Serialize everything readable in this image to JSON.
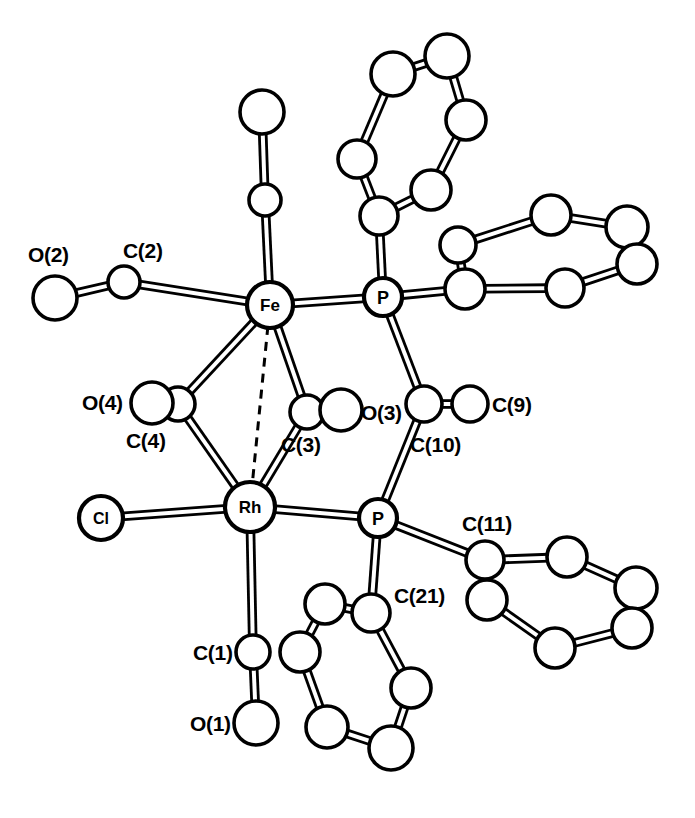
{
  "figure": {
    "background_color": "#ffffff",
    "line_color": "#000000",
    "width": 695,
    "height": 818
  },
  "chart_data": {
    "type": "diagram",
    "title": "",
    "atoms": [
      {
        "id": "Fe",
        "label": "Fe",
        "x": 270,
        "y": 305,
        "r": 23,
        "core_label": true,
        "font_size": 17
      },
      {
        "id": "Rh",
        "label": "Rh",
        "x": 250,
        "y": 507,
        "r": 25,
        "core_label": true,
        "font_size": 17
      },
      {
        "id": "P1",
        "label": "P",
        "x": 383,
        "y": 297,
        "r": 19,
        "core_label": true,
        "font_size": 18
      },
      {
        "id": "P2",
        "label": "P",
        "x": 378,
        "y": 518,
        "r": 19,
        "core_label": true,
        "font_size": 18
      },
      {
        "id": "Cl",
        "label": "Cl",
        "x": 101,
        "y": 518,
        "r": 22,
        "core_label": true,
        "font_size": 16
      },
      {
        "id": "C2",
        "label": "",
        "x": 124,
        "y": 282,
        "r": 16,
        "core_label": false,
        "font_size": 0
      },
      {
        "id": "O2",
        "label": "",
        "x": 55,
        "y": 298,
        "r": 22,
        "core_label": false,
        "font_size": 0
      },
      {
        "id": "C5",
        "label": "",
        "x": 265,
        "y": 200,
        "r": 16,
        "core_label": false,
        "font_size": 0
      },
      {
        "id": "O5",
        "label": "",
        "x": 262,
        "y": 112,
        "r": 22,
        "core_label": false,
        "font_size": 0
      },
      {
        "id": "C1",
        "label": "",
        "x": 253,
        "y": 652,
        "r": 17,
        "core_label": false,
        "font_size": 0
      },
      {
        "id": "O1",
        "label": "",
        "x": 256,
        "y": 723,
        "r": 22,
        "core_label": false,
        "font_size": 0
      },
      {
        "id": "C3",
        "label": "",
        "x": 307,
        "y": 412,
        "r": 17,
        "core_label": false,
        "font_size": 0
      },
      {
        "id": "O3",
        "label": "",
        "x": 341,
        "y": 410,
        "r": 21,
        "core_label": false,
        "font_size": 0
      },
      {
        "id": "C4",
        "label": "",
        "x": 178,
        "y": 404,
        "r": 17,
        "core_label": false,
        "font_size": 0
      },
      {
        "id": "O4",
        "label": "",
        "x": 152,
        "y": 403,
        "r": 21,
        "core_label": false,
        "font_size": 0
      },
      {
        "id": "C10",
        "label": "",
        "x": 424,
        "y": 404,
        "r": 18,
        "core_label": false,
        "font_size": 0
      },
      {
        "id": "C9",
        "label": "",
        "x": 470,
        "y": 404,
        "r": 18,
        "core_label": false,
        "font_size": 0
      },
      {
        "id": "C11",
        "label": "",
        "x": 485,
        "y": 560,
        "r": 19,
        "core_label": false,
        "font_size": 0
      },
      {
        "id": "C21",
        "label": "",
        "x": 371,
        "y": 613,
        "r": 19,
        "core_label": false,
        "font_size": 0
      },
      {
        "id": "RA1",
        "label": "",
        "x": 379,
        "y": 216,
        "r": 19,
        "core_label": false,
        "font_size": 0
      },
      {
        "id": "RA2",
        "label": "",
        "x": 357,
        "y": 159,
        "r": 19,
        "core_label": false,
        "font_size": 0
      },
      {
        "id": "RA3",
        "label": "",
        "x": 393,
        "y": 74,
        "r": 22,
        "core_label": false,
        "font_size": 0
      },
      {
        "id": "RA4",
        "label": "",
        "x": 447,
        "y": 56,
        "r": 22,
        "core_label": false,
        "font_size": 0
      },
      {
        "id": "RA5",
        "label": "",
        "x": 466,
        "y": 120,
        "r": 20,
        "core_label": false,
        "font_size": 0
      },
      {
        "id": "RA6",
        "label": "",
        "x": 431,
        "y": 190,
        "r": 20,
        "core_label": false,
        "font_size": 0
      },
      {
        "id": "RB1",
        "label": "",
        "x": 465,
        "y": 289,
        "r": 20,
        "core_label": false,
        "font_size": 0
      },
      {
        "id": "RB2",
        "label": "",
        "x": 458,
        "y": 245,
        "r": 18,
        "core_label": false,
        "font_size": 0
      },
      {
        "id": "RB3",
        "label": "",
        "x": 551,
        "y": 215,
        "r": 20,
        "core_label": false,
        "font_size": 0
      },
      {
        "id": "RB4",
        "label": "",
        "x": 627,
        "y": 227,
        "r": 21,
        "core_label": false,
        "font_size": 0
      },
      {
        "id": "RB5",
        "label": "",
        "x": 637,
        "y": 264,
        "r": 20,
        "core_label": false,
        "font_size": 0
      },
      {
        "id": "RB6",
        "label": "",
        "x": 565,
        "y": 288,
        "r": 19,
        "core_label": false,
        "font_size": 0
      },
      {
        "id": "RC1",
        "label": "",
        "x": 487,
        "y": 600,
        "r": 20,
        "core_label": false,
        "font_size": 0
      },
      {
        "id": "RC2",
        "label": "",
        "x": 567,
        "y": 557,
        "r": 20,
        "core_label": false,
        "font_size": 0
      },
      {
        "id": "RC3",
        "label": "",
        "x": 636,
        "y": 588,
        "r": 21,
        "core_label": false,
        "font_size": 0
      },
      {
        "id": "RC4",
        "label": "",
        "x": 632,
        "y": 628,
        "r": 20,
        "core_label": false,
        "font_size": 0
      },
      {
        "id": "RC5",
        "label": "",
        "x": 555,
        "y": 648,
        "r": 20,
        "core_label": false,
        "font_size": 0
      },
      {
        "id": "RD1",
        "label": "",
        "x": 325,
        "y": 604,
        "r": 20,
        "core_label": false,
        "font_size": 0
      },
      {
        "id": "RD2",
        "label": "",
        "x": 300,
        "y": 652,
        "r": 20,
        "core_label": false,
        "font_size": 0
      },
      {
        "id": "RD3",
        "label": "",
        "x": 327,
        "y": 727,
        "r": 21,
        "core_label": false,
        "font_size": 0
      },
      {
        "id": "RD4",
        "label": "",
        "x": 391,
        "y": 748,
        "r": 22,
        "core_label": false,
        "font_size": 0
      },
      {
        "id": "RD5",
        "label": "",
        "x": 411,
        "y": 688,
        "r": 20,
        "core_label": false,
        "font_size": 0
      }
    ],
    "bonds": [
      {
        "from": "Fe",
        "to": "Rh",
        "style": "dashed"
      },
      {
        "from": "Fe",
        "to": "C2",
        "style": "double"
      },
      {
        "from": "C2",
        "to": "O2",
        "style": "double"
      },
      {
        "from": "Fe",
        "to": "C5",
        "style": "double"
      },
      {
        "from": "C5",
        "to": "O5",
        "style": "double"
      },
      {
        "from": "Fe",
        "to": "P1",
        "style": "double"
      },
      {
        "from": "Fe",
        "to": "C3",
        "style": "double"
      },
      {
        "from": "Fe",
        "to": "C4",
        "style": "double"
      },
      {
        "from": "Rh",
        "to": "C3",
        "style": "double"
      },
      {
        "from": "Rh",
        "to": "C4",
        "style": "double"
      },
      {
        "from": "C3",
        "to": "O3",
        "style": "single"
      },
      {
        "from": "C4",
        "to": "O4",
        "style": "single"
      },
      {
        "from": "Rh",
        "to": "Cl",
        "style": "double"
      },
      {
        "from": "Rh",
        "to": "C1",
        "style": "double"
      },
      {
        "from": "C1",
        "to": "O1",
        "style": "double"
      },
      {
        "from": "Rh",
        "to": "P2",
        "style": "double"
      },
      {
        "from": "P1",
        "to": "C10",
        "style": "double"
      },
      {
        "from": "C10",
        "to": "P2",
        "style": "double"
      },
      {
        "from": "C10",
        "to": "C9",
        "style": "double"
      },
      {
        "from": "P1",
        "to": "RA1",
        "style": "double"
      },
      {
        "from": "RA1",
        "to": "RA2",
        "style": "double"
      },
      {
        "from": "RA2",
        "to": "RA3",
        "style": "double"
      },
      {
        "from": "RA3",
        "to": "RA4",
        "style": "double"
      },
      {
        "from": "RA4",
        "to": "RA5",
        "style": "double"
      },
      {
        "from": "RA5",
        "to": "RA6",
        "style": "double"
      },
      {
        "from": "RA6",
        "to": "RA1",
        "style": "double"
      },
      {
        "from": "P1",
        "to": "RB1",
        "style": "double"
      },
      {
        "from": "RB1",
        "to": "RB2",
        "style": "double"
      },
      {
        "from": "RB2",
        "to": "RB3",
        "style": "double"
      },
      {
        "from": "RB3",
        "to": "RB4",
        "style": "double"
      },
      {
        "from": "RB4",
        "to": "RB5",
        "style": "double"
      },
      {
        "from": "RB5",
        "to": "RB6",
        "style": "double"
      },
      {
        "from": "RB6",
        "to": "RB1",
        "style": "double"
      },
      {
        "from": "P2",
        "to": "C11",
        "style": "double"
      },
      {
        "from": "C11",
        "to": "RC1",
        "style": "double"
      },
      {
        "from": "C11",
        "to": "RC2",
        "style": "double"
      },
      {
        "from": "RC2",
        "to": "RC3",
        "style": "double"
      },
      {
        "from": "RC3",
        "to": "RC4",
        "style": "double"
      },
      {
        "from": "RC4",
        "to": "RC5",
        "style": "double"
      },
      {
        "from": "RC5",
        "to": "RC1",
        "style": "double"
      },
      {
        "from": "P2",
        "to": "C21",
        "style": "double"
      },
      {
        "from": "C21",
        "to": "RD1",
        "style": "double"
      },
      {
        "from": "C21",
        "to": "RD5",
        "style": "double"
      },
      {
        "from": "RD1",
        "to": "RD2",
        "style": "double"
      },
      {
        "from": "RD2",
        "to": "RD3",
        "style": "double"
      },
      {
        "from": "RD3",
        "to": "RD4",
        "style": "double"
      },
      {
        "from": "RD4",
        "to": "RD5",
        "style": "double"
      }
    ],
    "annotations": [
      {
        "id": "ann-O2",
        "text": "O(2)",
        "x": 28,
        "y": 262
      },
      {
        "id": "ann-C2",
        "text": "C(2)",
        "x": 123,
        "y": 258
      },
      {
        "id": "ann-O4",
        "text": "O(4)",
        "x": 82,
        "y": 410
      },
      {
        "id": "ann-C4",
        "text": "C(4)",
        "x": 126,
        "y": 448
      },
      {
        "id": "ann-C3",
        "text": "C(3)",
        "x": 281,
        "y": 452
      },
      {
        "id": "ann-O3",
        "text": "O(3)",
        "x": 361,
        "y": 420
      },
      {
        "id": "ann-C9",
        "text": "C(9)",
        "x": 492,
        "y": 412
      },
      {
        "id": "ann-C10",
        "text": "C(10)",
        "x": 410,
        "y": 452
      },
      {
        "id": "ann-C11",
        "text": "C(11)",
        "x": 462,
        "y": 531
      },
      {
        "id": "ann-C21",
        "text": "C(21)",
        "x": 394,
        "y": 603
      },
      {
        "id": "ann-C1",
        "text": "C(1)",
        "x": 193,
        "y": 660
      },
      {
        "id": "ann-O1",
        "text": "O(1)",
        "x": 190,
        "y": 731
      }
    ],
    "core_labels": [
      "Fe",
      "Rh",
      "P",
      "P",
      "Cl"
    ]
  }
}
